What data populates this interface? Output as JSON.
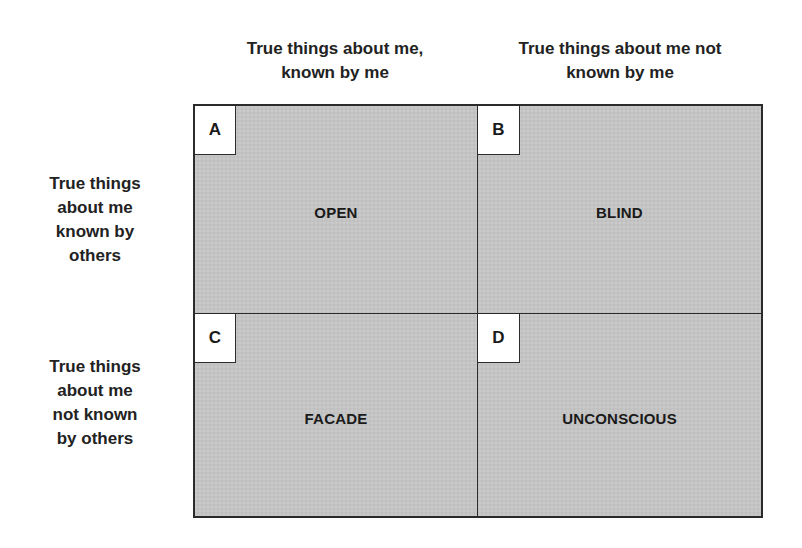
{
  "diagram": {
    "type": "johari-window-2x2",
    "column_headers": [
      "True things about me,\nknown by me",
      "True things about me not\nknown by me"
    ],
    "row_headers": [
      "True things\nabout me\nknown by\nothers",
      "True things\nabout me\nnot known\nby others"
    ],
    "quadrants": [
      {
        "letter": "A",
        "label": "OPEN"
      },
      {
        "letter": "B",
        "label": "BLIND"
      },
      {
        "letter": "C",
        "label": "FACADE"
      },
      {
        "letter": "D",
        "label": "UNCONSCIOUS"
      }
    ],
    "colors": {
      "quadrant_fill": "#c4c4c4",
      "border": "#2b2b2b",
      "letter_box_fill": "#ffffff",
      "text": "#1a1a1a"
    }
  }
}
